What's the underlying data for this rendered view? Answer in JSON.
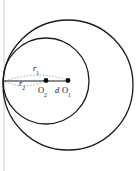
{
  "figure": {
    "canvas": {
      "width": 136,
      "height": 171,
      "background": "#ffffff"
    },
    "colors": {
      "stroke": "#1a1a1a",
      "dotted": "#9a9a9a",
      "margin_rule": "#cccccc",
      "point_fill": "#000000",
      "text": "#111111"
    },
    "margin_rule": {
      "name": "left-margin-line",
      "x": 4,
      "y1": 0,
      "y2": 171
    },
    "circles": [
      {
        "name": "outer-circle",
        "label": "circle O1",
        "cx": 68,
        "cy": 85,
        "r": 65,
        "stroke_width": 1.3
      },
      {
        "name": "inner-circle",
        "label": "circle O2",
        "cx": 46,
        "cy": 81,
        "r": 43,
        "stroke_width": 1.3
      }
    ],
    "tangent_point": {
      "name": "tangency-point",
      "x": 4,
      "y": 82
    },
    "centers": [
      {
        "name": "center-o2",
        "label": "O",
        "subscript": "2",
        "cx": 46,
        "cy": 80.5,
        "r": 2.4
      },
      {
        "name": "center-o1",
        "label": "O",
        "subscript": "1",
        "cx": 68,
        "cy": 80.5,
        "r": 2.4
      }
    ],
    "segments": [
      {
        "name": "radius-line",
        "x1": 4,
        "y1": 81,
        "x2": 68,
        "y2": 81,
        "stroke_width": 1.1,
        "style": "solid"
      }
    ],
    "arcs": [
      {
        "name": "r1-arc-upper",
        "description": "dotted arc above the radius line from tangency to O1",
        "path": "M 5 81 Q 36 70 68 80",
        "dash": "1.4 1.8"
      },
      {
        "name": "r2-arc-lower",
        "description": "dotted arc below the radius line from tangency to O2",
        "path": "M 5 82 Q 26 90 46 81",
        "dash": "1.4 1.8"
      }
    ],
    "labels": [
      {
        "name": "label-r1",
        "text": "r",
        "subscript": "1",
        "x": 33,
        "y": 64
      },
      {
        "name": "label-r2",
        "text": "r",
        "subscript": "2",
        "x": 19,
        "y": 79
      },
      {
        "name": "label-o2",
        "text": "O",
        "subscript": "2",
        "x": 38,
        "y": 86
      },
      {
        "name": "label-d",
        "text": "d",
        "subscript": "",
        "x": 55,
        "y": 86
      },
      {
        "name": "label-o1",
        "text": "O",
        "subscript": "1",
        "x": 62,
        "y": 86
      }
    ]
  }
}
